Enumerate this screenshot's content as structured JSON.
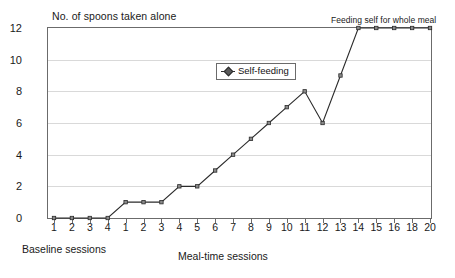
{
  "chart_data": {
    "type": "line",
    "title": "No. of spoons taken alone",
    "ylabel": "No. of spoons taken alone",
    "xlabel": "Meal-time sessions",
    "xlabel_secondary": "Baseline sessions",
    "ylim": [
      0,
      12
    ],
    "yticks": [
      0,
      2,
      4,
      6,
      8,
      10,
      12
    ],
    "ytick_labels": [
      "0",
      "2",
      "4",
      "6",
      "8",
      "10",
      "12"
    ],
    "grid": "horizontal",
    "legend": {
      "position": "inside-top-center",
      "entries": [
        {
          "name": "Self-feeding",
          "marker": "diamond",
          "color": "#2b2b2b"
        }
      ]
    },
    "annotations": [
      {
        "text": "Feeding self for whole meal",
        "x_category": "14",
        "y": 12
      }
    ],
    "phases": [
      {
        "name": "Baseline sessions",
        "categories": [
          "1",
          "2",
          "3",
          "4"
        ]
      },
      {
        "name": "Meal-time sessions",
        "categories": [
          "1",
          "2",
          "3",
          "4",
          "5",
          "6",
          "7",
          "8",
          "9",
          "10",
          "11",
          "12",
          "13",
          "14",
          "15",
          "16",
          "18",
          "20"
        ]
      }
    ],
    "categories": [
      "1",
      "2",
      "3",
      "4",
      "1",
      "2",
      "3",
      "4",
      "5",
      "6",
      "7",
      "8",
      "9",
      "10",
      "11",
      "12",
      "13",
      "14",
      "15",
      "16",
      "18",
      "20"
    ],
    "series": [
      {
        "name": "Self-feeding",
        "values": [
          0,
          0,
          0,
          0,
          1,
          1,
          1,
          2,
          2,
          3,
          4,
          5,
          6,
          7,
          8,
          6,
          9,
          12,
          12,
          12,
          12,
          12
        ]
      }
    ],
    "colors": {
      "line": "#2b2b2b",
      "marker_fill": "#8a8a8a",
      "marker_edge": "#2b2b2b",
      "axis": "#6b6b6b",
      "grid": "#d9d9d9",
      "background": "#ffffff",
      "text": "#1a1a1a"
    }
  }
}
